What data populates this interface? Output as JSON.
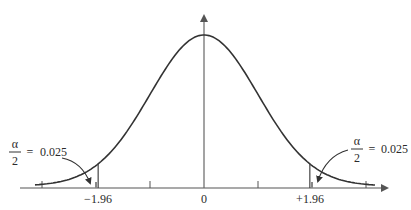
{
  "chart_data": {
    "type": "line",
    "title": "",
    "xlabel": "",
    "ylabel": "",
    "x_ticks": [
      -3,
      -1,
      0,
      1,
      3
    ],
    "x_tick_labels": [
      "",
      "",
      "0",
      "",
      ""
    ],
    "critical_values": [
      -1.96,
      1.96
    ],
    "critical_labels": [
      "−1.96",
      "+1.96"
    ],
    "tail_area": 0.025,
    "annotations": [
      {
        "side": "left",
        "numerator": "α",
        "denominator": "2",
        "equals": "=",
        "value": "0.025"
      },
      {
        "side": "right",
        "numerator": "α",
        "denominator": "2",
        "equals": "=",
        "value": "0.025"
      }
    ],
    "grid": false,
    "legend": null,
    "curve": "standard normal density"
  },
  "labels": {
    "zero": "0",
    "left_crit": "−1.96",
    "right_crit": "+1.96",
    "left_alpha": "α",
    "left_two": "2",
    "left_eq": "=",
    "left_val": "0.025",
    "right_alpha": "α",
    "right_two": "2",
    "right_eq": "=",
    "right_val": "0.025"
  },
  "colors": {
    "curve": "#333333",
    "axis": "#555555",
    "critical_line": "#444444"
  }
}
